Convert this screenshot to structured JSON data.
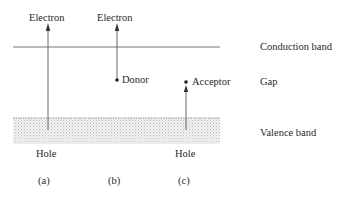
{
  "diagram": {
    "bands": {
      "conduction": "Conduction band",
      "gap": "Gap",
      "valence": "Valence band"
    },
    "panels": [
      {
        "id": "a",
        "caption": "(a)",
        "top_label": "Electron",
        "bottom_label": "Hole"
      },
      {
        "id": "b",
        "caption": "(b)",
        "top_label": "Electron",
        "level_label": "Donor"
      },
      {
        "id": "c",
        "caption": "(c)",
        "level_label": "Acceptor",
        "bottom_label": "Hole"
      }
    ],
    "colors": {
      "line": "#555555",
      "text": "#2a2a2a",
      "stipple": "#c8c8c8"
    }
  }
}
